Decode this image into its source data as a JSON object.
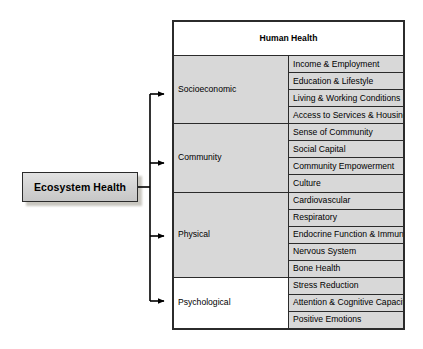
{
  "diagram": {
    "source": {
      "label": "Ecosystem Health"
    },
    "table": {
      "header": "Human Health",
      "groups": [
        {
          "name": "Socioeconomic",
          "shaded": true,
          "items": [
            "Income & Employment",
            "Education & Lifestyle",
            "Living & Working Conditions",
            "Access to Services & Housing"
          ]
        },
        {
          "name": "Community",
          "shaded": true,
          "items": [
            "Sense of Community",
            "Social Capital",
            "Community Empowerment",
            "Culture"
          ]
        },
        {
          "name": "Physical",
          "shaded": true,
          "items": [
            "Cardiovascular",
            "Respiratory",
            "Endocrine Function & Immunity",
            "Nervous System",
            "Bone Health"
          ]
        },
        {
          "name": "Psychological",
          "shaded": false,
          "items": [
            "Stress Reduction",
            "Attention & Cognitive Capacity",
            "Positive Emotions"
          ]
        }
      ]
    },
    "connectors": {
      "arrow_count": 4,
      "color": "#000000"
    }
  }
}
